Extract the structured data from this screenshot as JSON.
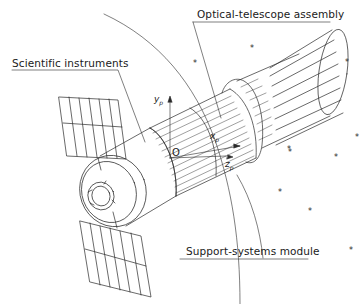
{
  "diagram": {
    "labels": {
      "optical_telescope": "Optical-telescope assembly",
      "scientific_instruments": "Scientific instruments",
      "support_systems": "Support-systems module"
    },
    "axes": {
      "y": "y",
      "x": "x",
      "z": "z",
      "subscript": "p",
      "origin": "O"
    },
    "stars": [
      {
        "x": 250,
        "y": 48
      },
      {
        "x": 195,
        "y": 62
      },
      {
        "x": 347,
        "y": 60
      },
      {
        "x": 290,
        "y": 152
      },
      {
        "x": 336,
        "y": 155
      },
      {
        "x": 280,
        "y": 192
      },
      {
        "x": 310,
        "y": 211
      },
      {
        "x": 351,
        "y": 249
      },
      {
        "x": 291,
        "y": 146
      }
    ],
    "colors": {
      "line": "#2a2a2a",
      "background": "#ffffff"
    }
  }
}
